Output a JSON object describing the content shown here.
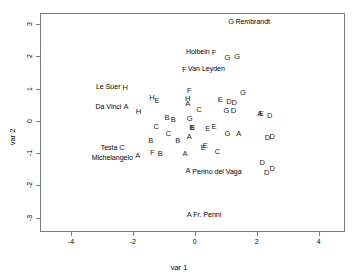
{
  "chart_data": {
    "type": "scatter",
    "title": "",
    "xlabel": "var 1",
    "ylabel": "var 2",
    "xlim": [
      -5,
      4.85
    ],
    "ylim": [
      -3.45,
      3.35
    ],
    "xticks": [
      -4,
      -2,
      0,
      2,
      4
    ],
    "xtick_labels": [
      "-4",
      "-2",
      "0",
      "2",
      "4"
    ],
    "yticks": [
      -3,
      -2,
      -1,
      0,
      1,
      2,
      3
    ],
    "ytick_labels": [
      "-3",
      "-2",
      "-1",
      "0",
      "1",
      "2",
      "3"
    ],
    "grid": false,
    "legend": "none",
    "marker_style": "letter-glyph",
    "points": [
      {
        "label": "G",
        "x": 1.17,
        "y": 3.07
      },
      {
        "label": "F",
        "x": 0.62,
        "y": 2.11
      },
      {
        "label": "G",
        "x": 1.05,
        "y": 1.95
      },
      {
        "label": "G",
        "x": 1.37,
        "y": 1.97
      },
      {
        "label": "F",
        "x": -0.33,
        "y": 1.58
      },
      {
        "label": "H",
        "x": -2.25,
        "y": 1.02
      },
      {
        "label": "F",
        "x": -0.18,
        "y": 0.92
      },
      {
        "label": "G",
        "x": 1.55,
        "y": 0.88
      },
      {
        "label": "H",
        "x": -1.38,
        "y": 0.7
      },
      {
        "label": "E",
        "x": -1.22,
        "y": 0.62
      },
      {
        "label": "H",
        "x": -0.23,
        "y": 0.67
      },
      {
        "label": "E",
        "x": 0.82,
        "y": 0.64
      },
      {
        "label": "D",
        "x": 1.1,
        "y": 0.6
      },
      {
        "label": "D",
        "x": 1.27,
        "y": 0.57
      },
      {
        "label": "A",
        "x": -2.22,
        "y": 0.44
      },
      {
        "label": "A",
        "x": -0.23,
        "y": 0.52
      },
      {
        "label": "C",
        "x": 0.13,
        "y": 0.35
      },
      {
        "label": "H",
        "x": -1.82,
        "y": 0.28
      },
      {
        "label": "G",
        "x": 1.02,
        "y": 0.31
      },
      {
        "label": "D",
        "x": 1.25,
        "y": 0.3
      },
      {
        "label": "A",
        "x": 2.1,
        "y": 0.22
      },
      {
        "label": "E",
        "x": 2.15,
        "y": 0.22
      },
      {
        "label": "D",
        "x": 2.42,
        "y": 0.16
      },
      {
        "label": "B",
        "x": -0.9,
        "y": 0.1
      },
      {
        "label": "B",
        "x": -0.7,
        "y": 0.03
      },
      {
        "label": "G",
        "x": -0.17,
        "y": 0.07
      },
      {
        "label": "C",
        "x": -1.25,
        "y": -0.2
      },
      {
        "label": "B",
        "x": -0.1,
        "y": -0.22
      },
      {
        "label": "E",
        "x": -0.07,
        "y": -0.21
      },
      {
        "label": "E",
        "x": 0.42,
        "y": -0.26
      },
      {
        "label": "E",
        "x": 0.62,
        "y": -0.2
      },
      {
        "label": "C",
        "x": -0.85,
        "y": -0.41
      },
      {
        "label": "G",
        "x": 1.05,
        "y": -0.42
      },
      {
        "label": "A",
        "x": 1.42,
        "y": -0.42
      },
      {
        "label": "A",
        "x": -0.18,
        "y": -0.5
      },
      {
        "label": "B",
        "x": -1.42,
        "y": -0.63
      },
      {
        "label": "B",
        "x": -0.55,
        "y": -0.62
      },
      {
        "label": "D",
        "x": 2.35,
        "y": -0.54
      },
      {
        "label": "D",
        "x": 2.5,
        "y": -0.5
      },
      {
        "label": "C",
        "x": -2.35,
        "y": -0.84
      },
      {
        "label": "E",
        "x": 0.27,
        "y": -0.83
      },
      {
        "label": "E",
        "x": 0.34,
        "y": -0.79
      },
      {
        "label": "F",
        "x": -1.37,
        "y": -1.0
      },
      {
        "label": "B",
        "x": -1.12,
        "y": -1.03
      },
      {
        "label": "A",
        "x": -0.32,
        "y": -1.02
      },
      {
        "label": "C",
        "x": 0.73,
        "y": -0.97
      },
      {
        "label": "A",
        "x": -1.84,
        "y": -1.1
      },
      {
        "label": "D",
        "x": 2.18,
        "y": -1.32
      },
      {
        "label": "A",
        "x": -0.22,
        "y": -1.55
      },
      {
        "label": "D",
        "x": 2.5,
        "y": -1.5
      },
      {
        "label": "D",
        "x": 2.32,
        "y": -1.62
      },
      {
        "label": "A",
        "x": -0.18,
        "y": -2.93
      }
    ],
    "annotations": [
      {
        "text": "Rembrandt",
        "x": 1.31,
        "y": 3.1,
        "align": "left"
      },
      {
        "text": "Holbein",
        "x": 0.48,
        "y": 2.17,
        "align": "right"
      },
      {
        "text": "Van Leyden",
        "x": -0.22,
        "y": 1.63,
        "align": "left"
      },
      {
        "text": "Le Suer",
        "x": -2.4,
        "y": 1.08,
        "align": "right"
      },
      {
        "text": "Da Vinci",
        "x": -2.37,
        "y": 0.46,
        "align": "right"
      },
      {
        "text": "Testa",
        "x": -2.5,
        "y": -0.8,
        "align": "right"
      },
      {
        "text": "Michelangelo",
        "x": -2.0,
        "y": -1.12,
        "align": "right"
      },
      {
        "text": "Perino del Vaga",
        "x": -0.08,
        "y": -1.56,
        "align": "left"
      },
      {
        "text": "Fr. Penni",
        "x": -0.05,
        "y": -2.88,
        "align": "left"
      }
    ]
  }
}
